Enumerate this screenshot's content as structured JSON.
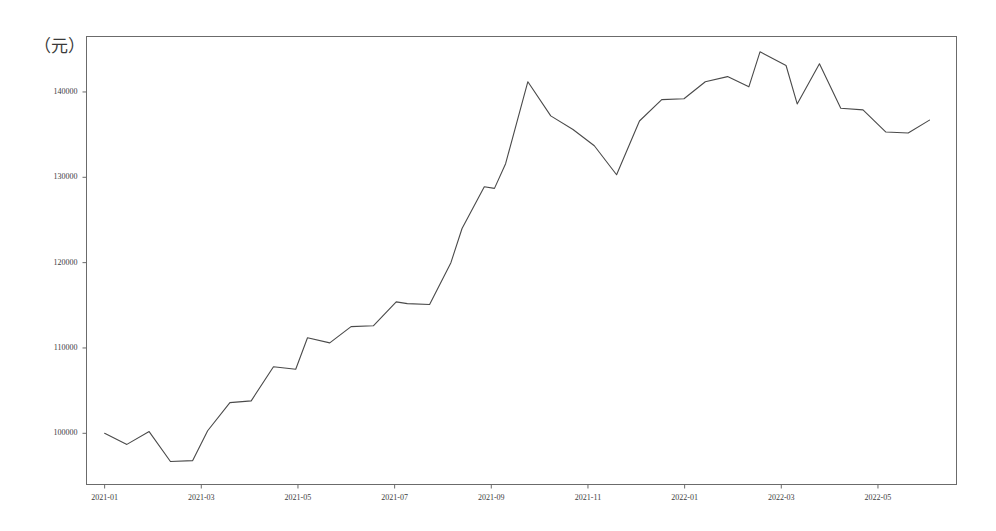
{
  "chart_data": {
    "type": "line",
    "title": "",
    "subtitle": "",
    "xlabel": "",
    "ylabel": "（元）",
    "ylim": [
      94000,
      146500
    ],
    "xlim": [
      "2020-12-20",
      "2022-06-20"
    ],
    "grid": false,
    "legend": null,
    "line_color": "#4a4a4a",
    "line_width": 1.1,
    "y_ticks": [
      100000,
      110000,
      120000,
      130000,
      140000
    ],
    "y_tick_labels": [
      "100000",
      "110000",
      "120000",
      "130000",
      "140000"
    ],
    "x_ticks": [
      "2021-01",
      "2021-03",
      "2021-05",
      "2021-07",
      "2021-09",
      "2021-11",
      "2022-01",
      "2022-03",
      "2022-05"
    ],
    "x_tick_labels": [
      "2021-01",
      "2021-03",
      "2021-05",
      "2021-07",
      "2021-09",
      "2021-11",
      "2022-01",
      "2022-03",
      "2022-05"
    ],
    "series": [
      {
        "name": "price",
        "x": [
          "2021-01-01",
          "2021-01-15",
          "2021-01-29",
          "2021-02-12",
          "2021-02-26",
          "2021-03-05",
          "2021-03-19",
          "2021-04-02",
          "2021-04-16",
          "2021-04-30",
          "2021-05-07",
          "2021-05-21",
          "2021-06-04",
          "2021-06-18",
          "2021-07-02",
          "2021-07-09",
          "2021-07-23",
          "2021-08-06",
          "2021-08-13",
          "2021-08-27",
          "2021-09-03",
          "2021-09-10",
          "2021-09-24",
          "2021-10-08",
          "2021-10-22",
          "2021-11-05",
          "2021-11-19",
          "2021-12-03",
          "2021-12-17",
          "2021-12-31",
          "2022-01-14",
          "2022-01-28",
          "2022-02-11",
          "2022-02-18",
          "2022-03-04",
          "2022-03-11",
          "2022-03-25",
          "2022-04-08",
          "2022-04-22",
          "2022-05-06",
          "2022-05-20",
          "2022-06-03"
        ],
        "values": [
          100000,
          98700,
          100200,
          96700,
          96800,
          100300,
          103600,
          103800,
          107800,
          107500,
          111200,
          110600,
          112500,
          112600,
          115400,
          115200,
          115100,
          120000,
          124000,
          128900,
          128700,
          131600,
          141200,
          137200,
          135600,
          133700,
          130300,
          136600,
          139100,
          139200,
          141200,
          141800,
          140600,
          144700,
          143100,
          138600,
          143300,
          138100,
          137900,
          135300,
          135200,
          136700
        ]
      }
    ]
  },
  "axis": {
    "unit_label": "（元）"
  }
}
